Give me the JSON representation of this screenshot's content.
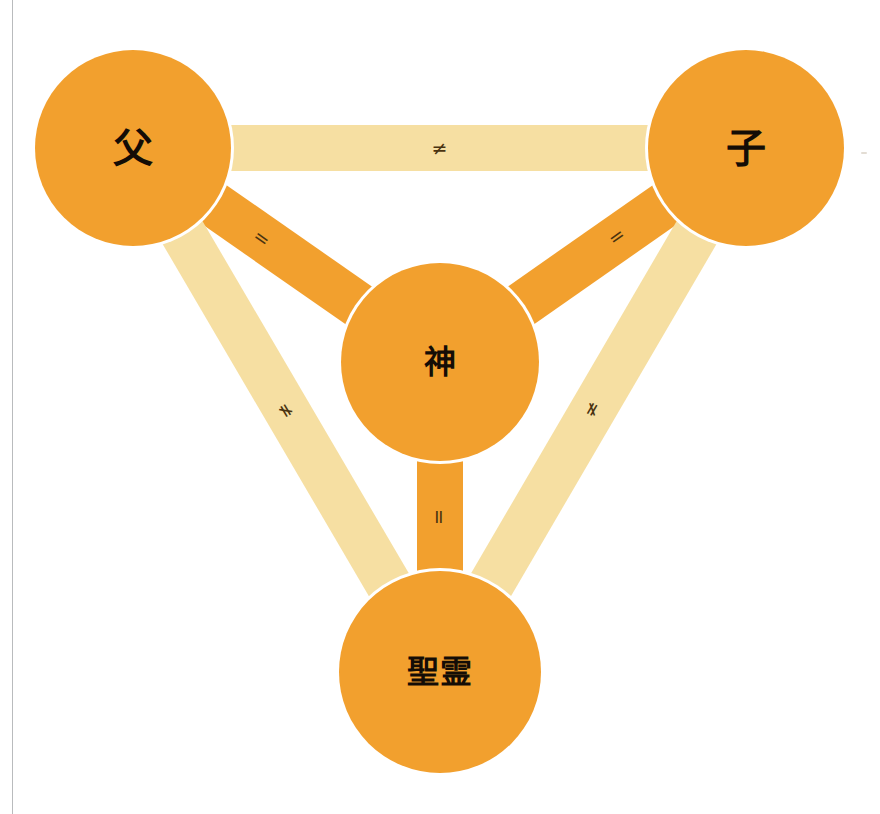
{
  "diagram": {
    "canvas": {
      "width": 880,
      "height": 814,
      "background": "#ffffff"
    },
    "colors": {
      "node_fill": "#F2A02E",
      "band_equal": "#F2A02E",
      "band_not_equal": "#F6DFA2",
      "node_text": "#140d06",
      "relation_text": "#4a3310",
      "node_outline": "#ffffff",
      "gutter_line": "#b9bbbd"
    },
    "nodes": [
      {
        "id": "father",
        "label": "父",
        "cx": 133,
        "cy": 148,
        "r": 98,
        "font_size": 40
      },
      {
        "id": "son",
        "label": "子",
        "cx": 746,
        "cy": 148,
        "r": 98,
        "font_size": 40
      },
      {
        "id": "god",
        "label": "神",
        "cx": 440,
        "cy": 362,
        "r": 99,
        "font_size": 32
      },
      {
        "id": "spirit",
        "label": "聖霊",
        "cx": 440,
        "cy": 672,
        "r": 101,
        "font_size": 32
      }
    ],
    "edges": [
      {
        "id": "father-son",
        "from": "father",
        "to": "son",
        "symbol": "≠",
        "kind": "not_equal",
        "width": 46,
        "label_pos": 0.5,
        "font_size": 19
      },
      {
        "id": "father-god",
        "from": "father",
        "to": "god",
        "symbol": "=",
        "kind": "equal",
        "width": 46,
        "label_pos": 0.42,
        "font_size": 19
      },
      {
        "id": "son-god",
        "from": "son",
        "to": "god",
        "symbol": "=",
        "kind": "equal",
        "width": 46,
        "label_pos": 0.42,
        "font_size": 19
      },
      {
        "id": "god-spirit",
        "from": "god",
        "to": "spirit",
        "symbol": "=",
        "kind": "equal",
        "width": 46,
        "label_pos": 0.5,
        "font_size": 19
      },
      {
        "id": "father-spirit",
        "from": "father",
        "to": "spirit",
        "symbol": "≠",
        "kind": "not_equal",
        "width": 46,
        "label_pos": 0.5,
        "font_size": 19
      },
      {
        "id": "son-spirit",
        "from": "son",
        "to": "spirit",
        "symbol": "≠",
        "kind": "not_equal",
        "width": 46,
        "label_pos": 0.5,
        "font_size": 19
      }
    ],
    "artifacts": {
      "gutter_line_x": 12,
      "speck_x": 861,
      "speck_y": 152
    }
  }
}
